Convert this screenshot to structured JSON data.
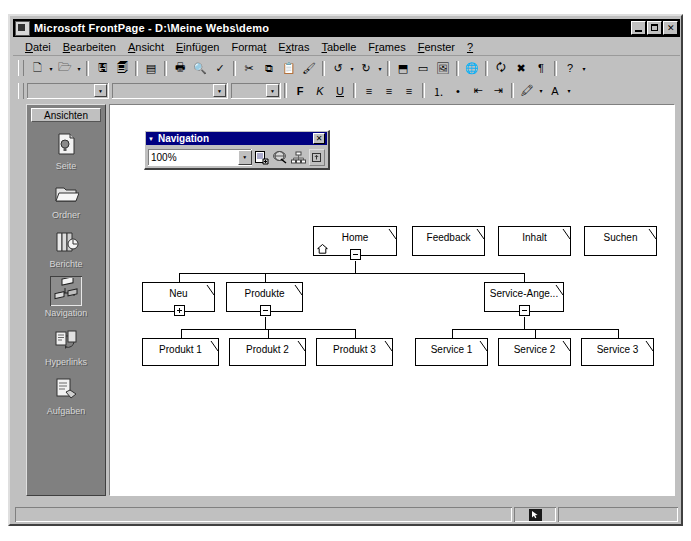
{
  "window": {
    "title": "Microsoft FrontPage - D:\\Meine Webs\\demo",
    "app_icon": "frontpage-icon",
    "buttons": {
      "minimize": "_",
      "maximize": "□",
      "close": "✕"
    }
  },
  "menu": {
    "items": [
      {
        "name": "menu-datei",
        "label": "Datei",
        "accel": "D"
      },
      {
        "name": "menu-bearbeiten",
        "label": "Bearbeiten",
        "accel": "B"
      },
      {
        "name": "menu-ansicht",
        "label": "Ansicht",
        "accel": "A"
      },
      {
        "name": "menu-einfuegen",
        "label": "Einfügen",
        "accel": "E"
      },
      {
        "name": "menu-format",
        "label": "Format",
        "accel": "t"
      },
      {
        "name": "menu-extras",
        "label": "Extras",
        "accel": "x"
      },
      {
        "name": "menu-tabelle",
        "label": "Tabelle",
        "accel": "T"
      },
      {
        "name": "menu-frames",
        "label": "Frames",
        "accel": "r"
      },
      {
        "name": "menu-fenster",
        "label": "Fenster",
        "accel": "F"
      },
      {
        "name": "menu-help",
        "label": "?",
        "accel": "?"
      }
    ]
  },
  "toolbar_standard": {
    "buttons": [
      {
        "name": "new-page-button",
        "glyph": "🗋",
        "dropdown": true
      },
      {
        "name": "open-button",
        "glyph": "🗁",
        "dropdown": true
      },
      {
        "name": "save-button",
        "glyph": "🖫",
        "dropdown": false
      },
      {
        "name": "publish-web-button",
        "glyph": "🗐",
        "dropdown": false
      },
      {
        "name": "folder-list-button",
        "glyph": "▤",
        "dropdown": false
      },
      {
        "name": "print-button",
        "glyph": "🖶",
        "dropdown": false
      },
      {
        "name": "print-preview-button",
        "glyph": "🔍",
        "dropdown": false
      },
      {
        "name": "spelling-button",
        "glyph": "✓",
        "dropdown": false
      },
      {
        "name": "cut-button",
        "glyph": "✂",
        "dropdown": false
      },
      {
        "name": "copy-button",
        "glyph": "⧉",
        "dropdown": false
      },
      {
        "name": "paste-button",
        "glyph": "📋",
        "dropdown": false
      },
      {
        "name": "format-painter-button",
        "glyph": "🖌",
        "dropdown": false
      },
      {
        "name": "undo-button",
        "glyph": "↺",
        "dropdown": true
      },
      {
        "name": "redo-button",
        "glyph": "↻",
        "dropdown": true
      },
      {
        "name": "insert-component-button",
        "glyph": "⬒",
        "dropdown": false
      },
      {
        "name": "insert-table-button",
        "glyph": "▭",
        "dropdown": false
      },
      {
        "name": "insert-picture-button",
        "glyph": "🖼",
        "dropdown": false
      },
      {
        "name": "hyperlink-button",
        "glyph": "🌐",
        "dropdown": false
      },
      {
        "name": "refresh-button",
        "glyph": "🗘",
        "dropdown": false
      },
      {
        "name": "stop-button",
        "glyph": "✖",
        "dropdown": false
      },
      {
        "name": "show-marks-button",
        "glyph": "¶",
        "dropdown": false
      },
      {
        "name": "help-button",
        "glyph": "?",
        "dropdown": true
      }
    ]
  },
  "toolbar_formatting": {
    "style_value": "",
    "font_value": "",
    "size_value": "",
    "buttons": [
      {
        "name": "bold-button",
        "glyph": "F"
      },
      {
        "name": "italic-button",
        "glyph": "K"
      },
      {
        "name": "underline-button",
        "glyph": "U"
      },
      {
        "name": "align-left-button",
        "glyph": "≡"
      },
      {
        "name": "align-center-button",
        "glyph": "≡"
      },
      {
        "name": "align-right-button",
        "glyph": "≡"
      },
      {
        "name": "numbered-list-button",
        "glyph": "⒈"
      },
      {
        "name": "bulleted-list-button",
        "glyph": "•"
      },
      {
        "name": "decrease-indent-button",
        "glyph": "⇤"
      },
      {
        "name": "increase-indent-button",
        "glyph": "⇥"
      },
      {
        "name": "highlight-button",
        "glyph": "🖍"
      },
      {
        "name": "font-color-button",
        "glyph": "A"
      }
    ]
  },
  "views_bar": {
    "title": "Ansichten",
    "items": [
      {
        "name": "sidebar-item-seite",
        "label": "Seite",
        "icon": "page-icon",
        "selected": false
      },
      {
        "name": "sidebar-item-ordner",
        "label": "Ordner",
        "icon": "folder-icon",
        "selected": false
      },
      {
        "name": "sidebar-item-berichte",
        "label": "Berichte",
        "icon": "reports-icon",
        "selected": false
      },
      {
        "name": "sidebar-item-navigation",
        "label": "Navigation",
        "icon": "navigation-icon",
        "selected": true
      },
      {
        "name": "sidebar-item-hyperlinks",
        "label": "Hyperlinks",
        "icon": "hyperlinks-icon",
        "selected": false
      },
      {
        "name": "sidebar-item-aufgaben",
        "label": "Aufgaben",
        "icon": "tasks-icon",
        "selected": false
      }
    ]
  },
  "nav_toolbar": {
    "title": "Navigation",
    "menu_arrow_icon": "chevron-down-icon",
    "close_label": "✕",
    "zoom_value": "100%",
    "zoom_options": [
      "100%",
      "75%",
      "50%",
      "Einpassen"
    ],
    "buttons": [
      {
        "name": "add-existing-page-button",
        "icon": "add-page-icon"
      },
      {
        "name": "external-link-button",
        "icon": "globe-link-icon"
      },
      {
        "name": "view-subtree-button",
        "icon": "subtree-icon"
      },
      {
        "name": "portrait-landscape-button",
        "icon": "rotate-view-icon"
      }
    ]
  },
  "tree": {
    "nodes": [
      {
        "id": "home",
        "label": "Home",
        "x": 302,
        "y": 209,
        "w": 84,
        "h": 30,
        "toggle": "minus",
        "home_icon": true
      },
      {
        "id": "feedback",
        "label": "Feedback",
        "x": 401,
        "y": 209,
        "w": 73,
        "h": 30,
        "toggle": "none",
        "home_icon": false
      },
      {
        "id": "inhalt",
        "label": "Inhalt",
        "x": 487,
        "y": 209,
        "w": 73,
        "h": 30,
        "toggle": "none",
        "home_icon": false
      },
      {
        "id": "suchen",
        "label": "Suchen",
        "x": 573,
        "y": 209,
        "w": 73,
        "h": 30,
        "toggle": "none",
        "home_icon": false
      },
      {
        "id": "neu",
        "label": "Neu",
        "x": 131,
        "y": 265,
        "w": 73,
        "h": 30,
        "toggle": "plus",
        "home_icon": false
      },
      {
        "id": "produkte",
        "label": "Produkte",
        "x": 215,
        "y": 265,
        "w": 77,
        "h": 30,
        "toggle": "minus",
        "home_icon": false
      },
      {
        "id": "service-angebot",
        "label": "Service-Ange...",
        "x": 473,
        "y": 265,
        "w": 80,
        "h": 30,
        "toggle": "minus",
        "home_icon": false
      },
      {
        "id": "produkt1",
        "label": "Produkt 1",
        "x": 131,
        "y": 321,
        "w": 77,
        "h": 28,
        "toggle": "none",
        "home_icon": false
      },
      {
        "id": "produkt2",
        "label": "Produkt 2",
        "x": 218,
        "y": 321,
        "w": 77,
        "h": 28,
        "toggle": "none",
        "home_icon": false
      },
      {
        "id": "produkt3",
        "label": "Produkt 3",
        "x": 305,
        "y": 321,
        "w": 77,
        "h": 28,
        "toggle": "none",
        "home_icon": false
      },
      {
        "id": "service1",
        "label": "Service 1",
        "x": 404,
        "y": 321,
        "w": 73,
        "h": 28,
        "toggle": "none",
        "home_icon": false
      },
      {
        "id": "service2",
        "label": "Service 2",
        "x": 487,
        "y": 321,
        "w": 73,
        "h": 28,
        "toggle": "none",
        "home_icon": false
      },
      {
        "id": "service3",
        "label": "Service 3",
        "x": 570,
        "y": 321,
        "w": 73,
        "h": 28,
        "toggle": "none",
        "home_icon": false
      }
    ],
    "colors": {
      "node_fill": "#ffffff",
      "node_border": "#000000",
      "connector": "#000000"
    }
  },
  "status_bar": {
    "left_text": "",
    "right_text": "",
    "icon": "pointer-mode-icon"
  }
}
